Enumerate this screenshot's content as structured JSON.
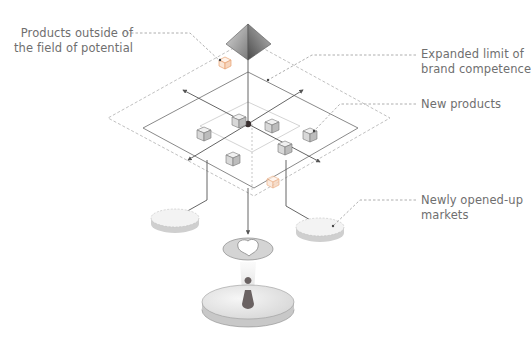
{
  "diagram": {
    "labels": {
      "outside_products": {
        "line1": "Products outside of",
        "line2": "the field of potential"
      },
      "expanded_limit": {
        "line1": "Expanded limit of",
        "line2": "brand competence"
      },
      "new_products": {
        "line1": "New products"
      },
      "new_markets": {
        "line1": "Newly opened-up",
        "line2": "markets"
      }
    },
    "colors": {
      "line": "#5a5a5a",
      "dashed": "#9a9a9a",
      "text": "#6f6f6f",
      "accent_orange": "#e8a070",
      "cube_face": "#e6e6e6",
      "disc": "#eeeeee"
    }
  }
}
